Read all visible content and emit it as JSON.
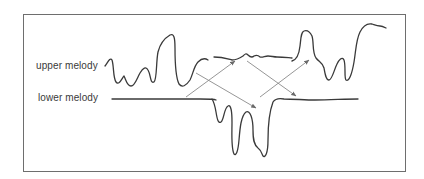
{
  "diagram": {
    "labels": {
      "upper": "upper melody",
      "lower": "lower melody"
    },
    "colors": {
      "frame": "#6e6e6e",
      "melody_line": "#3a3a3a",
      "arrow": "#8a8a8a",
      "text": "#3a3a3a",
      "background": "#ffffff"
    },
    "arrows": [
      {
        "name": "arrow-lower-to-upper-1",
        "from": "lower",
        "to": "upper"
      },
      {
        "name": "arrow-upper-to-lower-1",
        "from": "upper",
        "to": "lower"
      },
      {
        "name": "arrow-lower-to-upper-2",
        "from": "lower",
        "to": "upper"
      },
      {
        "name": "arrow-upper-to-lower-2",
        "from": "upper",
        "to": "lower"
      }
    ]
  }
}
